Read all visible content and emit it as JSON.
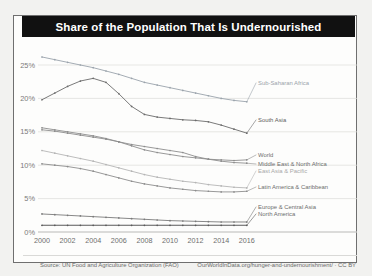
{
  "card": {
    "title": "Share of the Population That Is Undernourished",
    "source": "Source: UN Food and Agriculture Organization (FAO)",
    "url": "OurWorldInData.org/hunger-and-undernourishment/ · CC BY"
  },
  "chart_data": {
    "type": "line",
    "title": "Share of the Population That Is Undernourished",
    "xlabel": "",
    "ylabel": "",
    "x": [
      2000,
      2001,
      2002,
      2003,
      2004,
      2005,
      2006,
      2007,
      2008,
      2009,
      2010,
      2011,
      2012,
      2013,
      2014,
      2015,
      2016
    ],
    "xticks": [
      "2000",
      "2002",
      "2004",
      "2006",
      "2008",
      "2010",
      "2012",
      "2014",
      "2016"
    ],
    "yticks": [
      "0%",
      "5%",
      "10%",
      "15%",
      "20%",
      "25%"
    ],
    "ylim": [
      0,
      27
    ],
    "xlim": [
      2000,
      2017.5
    ],
    "grid": true,
    "legend_position": "right-inline-labels",
    "series": [
      {
        "name": "Sub-Saharan Africa",
        "color": "#9aa3ab",
        "label_color": "#9aa3ab",
        "values": [
          26.2,
          25.8,
          25.4,
          25.0,
          24.6,
          24.1,
          23.6,
          23.0,
          22.4,
          22.0,
          21.6,
          21.2,
          20.8,
          20.4,
          20.0,
          19.7,
          19.5
        ]
      },
      {
        "name": "South Asia",
        "color": "#6b6b6b",
        "label_color": "#5d5d5d",
        "values": [
          19.8,
          20.8,
          21.8,
          22.6,
          23.0,
          22.4,
          20.7,
          18.8,
          17.6,
          17.2,
          17.0,
          16.8,
          16.7,
          16.5,
          16.0,
          15.4,
          14.8
        ]
      },
      {
        "name": "World",
        "color": "#8d8d8d",
        "label_color": "#6e6e6e",
        "values": [
          15.6,
          15.3,
          15.0,
          14.7,
          14.4,
          14.0,
          13.5,
          12.9,
          12.3,
          11.9,
          11.6,
          11.3,
          11.1,
          10.9,
          10.8,
          10.7,
          10.8
        ]
      },
      {
        "name": "Middle East & North Africa",
        "color": "#8d8d8d",
        "label_color": "#6e6e6e",
        "values": [
          15.3,
          15.1,
          14.8,
          14.5,
          14.2,
          13.9,
          13.5,
          13.1,
          12.8,
          12.5,
          12.2,
          11.9,
          11.3,
          10.9,
          10.6,
          10.4,
          10.3
        ]
      },
      {
        "name": "East Asia & Pacific",
        "color": "#b5b5b5",
        "label_color": "#a8a8a8",
        "values": [
          12.2,
          11.8,
          11.4,
          11.0,
          10.6,
          10.1,
          9.6,
          9.1,
          8.6,
          8.2,
          7.9,
          7.6,
          7.4,
          7.1,
          6.9,
          6.7,
          6.6
        ]
      },
      {
        "name": "Latin America & Caribbean",
        "color": "#8d8d8d",
        "label_color": "#6e6e6e",
        "values": [
          10.2,
          10.0,
          9.8,
          9.5,
          9.1,
          8.6,
          8.1,
          7.6,
          7.2,
          6.9,
          6.6,
          6.4,
          6.2,
          6.1,
          6.0,
          6.0,
          6.1
        ]
      },
      {
        "name": "Europe & Central Asia",
        "color": "#7a7a7a",
        "label_color": "#6e6e6e",
        "values": [
          2.7,
          2.6,
          2.5,
          2.4,
          2.3,
          2.2,
          2.1,
          2.0,
          1.9,
          1.8,
          1.7,
          1.65,
          1.6,
          1.55,
          1.5,
          1.5,
          1.5
        ]
      },
      {
        "name": "North America",
        "color": "#5a5a5a",
        "label_color": "#6e6e6e",
        "values": [
          1.0,
          1.0,
          1.0,
          1.0,
          1.0,
          1.0,
          1.0,
          1.0,
          1.0,
          1.0,
          1.0,
          1.0,
          1.0,
          1.0,
          1.0,
          1.0,
          1.0
        ]
      }
    ],
    "series_labels": [
      {
        "name": "Sub-Saharan Africa",
        "x": 276,
        "y": 85
      },
      {
        "name": "South Asia",
        "x": 276,
        "y": 122
      },
      {
        "name": "World",
        "x": 276,
        "y": 157
      },
      {
        "name": "Middle East & North Africa",
        "x": 276,
        "y": 166
      },
      {
        "name": "East Asia & Pacific",
        "x": 276,
        "y": 173
      },
      {
        "name": "Latin America & Caribbean",
        "x": 276,
        "y": 189
      },
      {
        "name": "Europe & Central Asia",
        "x": 276,
        "y": 209
      },
      {
        "name": "North America",
        "x": 276,
        "y": 216
      }
    ]
  }
}
